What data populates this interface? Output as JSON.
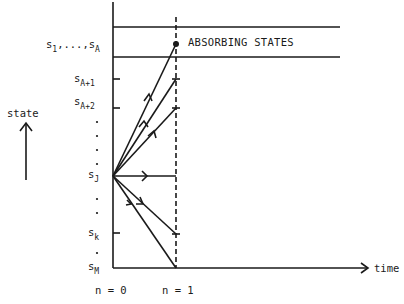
{
  "diagram": {
    "colors": {
      "ink": "#1a1a1a",
      "background": "#ffffff"
    },
    "axis": {
      "y_label": "state",
      "x_label": "time",
      "y_arrow_icon": "up-arrow-icon",
      "x_arrow_icon": "right-arrow-icon"
    },
    "annotation": "ABSORBING STATES",
    "states": [
      {
        "id": "s1_sA",
        "base": "s",
        "sub1": "1",
        "sep": ",...,",
        "base2": "s",
        "sub2": "A"
      },
      {
        "id": "sA1",
        "base": "s",
        "sub": "A+1"
      },
      {
        "id": "sA2",
        "base": "s",
        "sub": "A+2"
      },
      {
        "id": "sJ",
        "base": "s",
        "sub": "J"
      },
      {
        "id": "sk",
        "base": "s",
        "sub": "k"
      },
      {
        "id": "sM",
        "base": "s",
        "sub": "M"
      }
    ],
    "time_steps": [
      {
        "id": "n0",
        "label": "n = 0"
      },
      {
        "id": "n1",
        "label": "n = 1"
      }
    ],
    "ellipsis_dot": "."
  }
}
